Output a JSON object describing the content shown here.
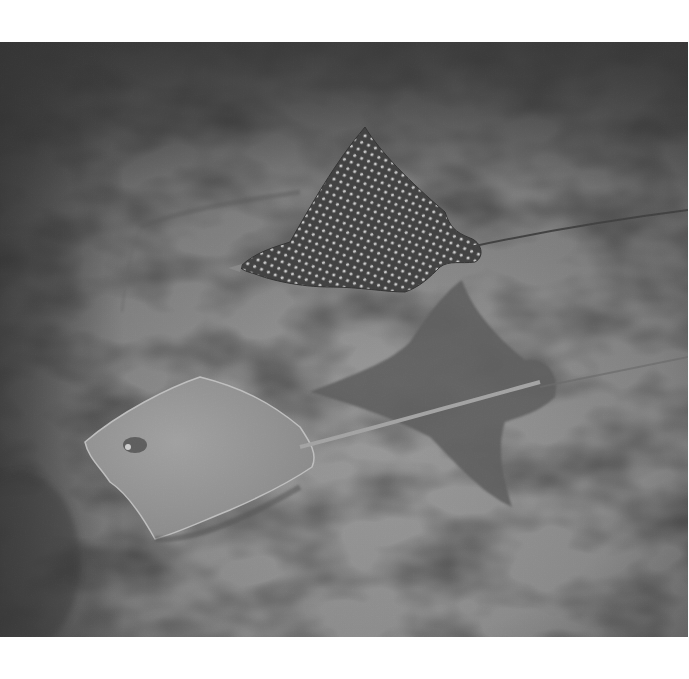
{
  "image": {
    "subject": "Spotted eagle ray swimming above a stingray over sandy seafloor",
    "style": "grayscale underwater photograph",
    "elements": [
      {
        "name": "eagle-ray",
        "description": "dark ray covered in white spots, swimming left with long thin tail to the right"
      },
      {
        "name": "eagle-ray-shadow",
        "description": "dark ray-shaped shadow on the sand below the eagle ray"
      },
      {
        "name": "stingray",
        "description": "pale smooth stingray resting on the sand, tail extending right"
      },
      {
        "name": "sand-seafloor",
        "description": "textured sandy bottom with dappled light"
      }
    ],
    "colors": {
      "margin": "#ffffff",
      "sand_light": "#a8a8a8",
      "sand_dark": "#3c3c3c",
      "ray_dark": "#3a3a3a",
      "shadow": "#5e5e5e",
      "stingray": "#9a9a9a"
    }
  }
}
